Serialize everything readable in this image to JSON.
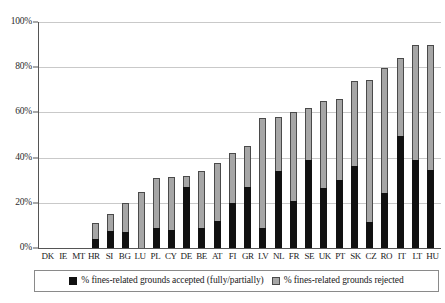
{
  "chart_data": {
    "type": "bar",
    "stacked": true,
    "title": "",
    "subtitle": "",
    "xlabel": "",
    "ylabel": "",
    "ylim": [
      0,
      100
    ],
    "yticks": [
      "0%",
      "20%",
      "40%",
      "60%",
      "80%",
      "100%"
    ],
    "ytick_values": [
      0,
      20,
      40,
      60,
      80,
      100
    ],
    "grid": true,
    "legend_position": "bottom",
    "categories": [
      "DK",
      "IE",
      "MT",
      "HR",
      "SI",
      "BG",
      "LU",
      "PL",
      "CY",
      "DE",
      "BE",
      "AT",
      "FI",
      "GR",
      "LV",
      "NL",
      "FR",
      "SE",
      "UK",
      "PT",
      "SK",
      "CZ",
      "RO",
      "IT",
      "LT",
      "HU"
    ],
    "series": [
      {
        "name": "% fines-related grounds accepted (fully/partially)",
        "color": "#111111",
        "values": [
          0,
          0,
          0,
          4,
          7.5,
          7,
          0,
          9,
          8,
          27,
          9,
          12,
          20,
          27,
          9,
          34,
          21,
          39,
          26.5,
          30,
          36.5,
          11.5,
          24.5,
          49.5,
          39,
          34.5
        ]
      },
      {
        "name": "% fines-related grounds rejected",
        "color": "#a6a6a6",
        "values": [
          0,
          0,
          0,
          7,
          7.5,
          13,
          25,
          22,
          23.5,
          5,
          25,
          25.5,
          22,
          18,
          48.5,
          24,
          39,
          23,
          38.5,
          36,
          37.5,
          63,
          55,
          34.5,
          51,
          55.5
        ]
      }
    ],
    "totals": [
      0,
      0,
      0,
      11,
      15,
      20,
      25,
      31,
      31.5,
      32,
      34,
      37.5,
      42,
      45,
      57.5,
      58,
      60,
      62,
      65,
      66,
      74,
      74.5,
      79.5,
      84,
      90,
      90
    ]
  },
  "legend": {
    "entries": [
      {
        "label": "% fines-related grounds accepted (fully/partially)",
        "swatch": "accepted"
      },
      {
        "label": "% fines-related grounds rejected",
        "swatch": "rejected"
      }
    ]
  }
}
